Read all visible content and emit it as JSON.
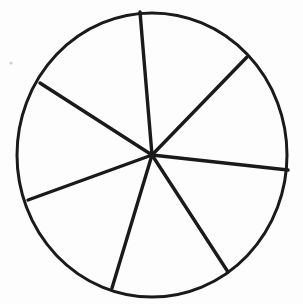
{
  "document": {
    "title": "Circle divided into seven sectors",
    "background_color": "#fdfdfd",
    "width": 303,
    "height": 304,
    "medium": "hand-drawn line illustration"
  },
  "chart_data": {
    "type": "pie",
    "xlabel": "",
    "ylabel": "",
    "grid": false,
    "legend_position": "none",
    "labels_visible": false,
    "center": {
      "x": 152,
      "y": 155
    },
    "radius": {
      "rx": 135,
      "ry": 142
    },
    "stroke_color": "#1a1a1a",
    "fill_color": "#ffffff",
    "outline_width": 3,
    "spoke_width": 3.4,
    "categories": [
      "sector-1",
      "sector-2",
      "sector-3",
      "sector-4",
      "sector-5",
      "sector-6",
      "sector-7"
    ],
    "values": [
      48.9,
      52.2,
      50.6,
      49.8,
      53.3,
      52.8,
      52.4
    ],
    "units": "degrees",
    "spoke_angles_deg": [
      94.8,
      45.9,
      -6.3,
      -56.9,
      -106.7,
      -160.0,
      147.2
    ],
    "spokes": [
      {
        "name": "spoke-top",
        "angle_deg": 94.8,
        "x1": 152,
        "y1": 155,
        "x2": 140,
        "y2": 12
      },
      {
        "name": "spoke-upper-right",
        "angle_deg": 45.9,
        "x1": 152,
        "y1": 155,
        "x2": 247,
        "y2": 57
      },
      {
        "name": "spoke-right",
        "angle_deg": -6.3,
        "x1": 152,
        "y1": 155,
        "x2": 288,
        "y2": 170
      },
      {
        "name": "spoke-lower-right",
        "angle_deg": -56.9,
        "x1": 152,
        "y1": 155,
        "x2": 228,
        "y2": 272
      },
      {
        "name": "spoke-bottom",
        "angle_deg": -106.7,
        "x1": 152,
        "y1": 155,
        "x2": 112,
        "y2": 288
      },
      {
        "name": "spoke-lower-left",
        "angle_deg": -160.0,
        "x1": 152,
        "y1": 155,
        "x2": 28,
        "y2": 200
      },
      {
        "name": "spoke-upper-left",
        "angle_deg": 147.2,
        "x1": 152,
        "y1": 155,
        "x2": 40,
        "y2": 83
      }
    ],
    "sector_count": 7,
    "annotations": []
  },
  "artifacts": [
    {
      "name": "ink-speck",
      "x": 11,
      "y": 63,
      "radius": 1.6,
      "color": "#cfcfcf"
    }
  ]
}
